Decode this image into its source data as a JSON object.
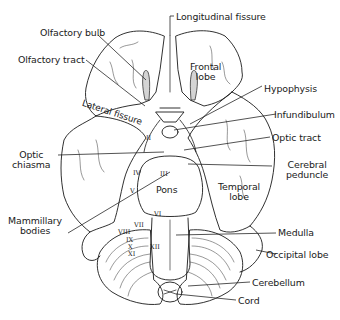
{
  "figure": {
    "colors": {
      "ink": "#1a1a1a",
      "background": "#ffffff",
      "tract_fill": "#d4d4d4"
    }
  },
  "labels": {
    "longitudinal_fissure": "Longitudinal fissure",
    "olfactory_bulb": "Olfactory bulb",
    "olfactory_tract": "Olfactory tract",
    "frontal_lobe_1": "Frontal",
    "frontal_lobe_2": "lobe",
    "lateral_fissure": "Lateral fissure",
    "hypophysis": "Hypophysis",
    "infundibulum": "Infundibulum",
    "optic_tract": "Optic tract",
    "optic_chiasma_1": "Optic",
    "optic_chiasma_2": "chiasma",
    "cerebral_peduncle_1": "Cerebral",
    "cerebral_peduncle_2": "peduncle",
    "temporal_lobe_1": "Temporal",
    "temporal_lobe_2": "lobe",
    "pons": "Pons",
    "mammillary_bodies_1": "Mammillary",
    "mammillary_bodies_2": "bodies",
    "medulla": "Medulla",
    "occipital_lobe": "Occipital lobe",
    "cerebellum": "Cerebellum",
    "cord": "Cord"
  },
  "cranial_nerves": {
    "ii": "II",
    "iii": "III",
    "iv": "IV",
    "v": "V",
    "vi": "VI",
    "vii": "VII",
    "viii": "VIII",
    "ix": "IX",
    "x": "X",
    "xi": "XI",
    "xii": "XII"
  }
}
